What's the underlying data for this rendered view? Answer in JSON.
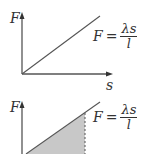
{
  "figures": [
    {
      "id": "graph-1",
      "y_axis_label": "F",
      "x_axis_label": "s",
      "equation": {
        "lhs": "F",
        "op": "=",
        "numerator": "λs",
        "denominator": "l"
      },
      "shaded": false
    },
    {
      "id": "graph-2",
      "y_axis_label": "F",
      "equation": {
        "lhs": "F",
        "op": "=",
        "numerator": "λs",
        "denominator": "l"
      },
      "shaded": true,
      "shade_color": "#c8c8c8",
      "dashed_line": true
    }
  ],
  "colors": {
    "line": "#555555",
    "text": "#333333",
    "shade": "#c8c8c8"
  }
}
